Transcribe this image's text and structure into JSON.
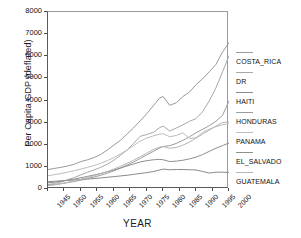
{
  "chart_data": {
    "type": "line",
    "title": "",
    "xlabel": "YEAR",
    "ylabel": "Per Capita GDP (deflated)",
    "xlim": [
      1945,
      2000
    ],
    "ylim": [
      0,
      8000
    ],
    "grid": false,
    "legend_position": "right",
    "xticks": [
      "1945",
      "1950",
      "1955",
      "1960",
      "1965",
      "1970",
      "1975",
      "1980",
      "1985",
      "1990",
      "1995",
      "2000"
    ],
    "yticks": [
      "0",
      "1000",
      "2000",
      "3000",
      "4000",
      "5000",
      "6000",
      "7000",
      "8000"
    ],
    "x": [
      1945,
      1947,
      1949,
      1951,
      1953,
      1955,
      1957,
      1959,
      1961,
      1963,
      1965,
      1967,
      1969,
      1971,
      1973,
      1975,
      1977,
      1979,
      1980,
      1982,
      1984,
      1986,
      1988,
      1990,
      1992,
      1994,
      1996,
      1998,
      2000
    ],
    "series": [
      {
        "name": "COSTA_RICA",
        "color": "#9a9a9a",
        "values": [
          880,
          930,
          980,
          1040,
          1120,
          1240,
          1320,
          1420,
          1560,
          1760,
          1980,
          2200,
          2480,
          2760,
          3080,
          3400,
          3760,
          4120,
          4180,
          3780,
          3900,
          4180,
          4380,
          4720,
          4980,
          5300,
          5620,
          6180,
          6620
        ]
      },
      {
        "name": "DR",
        "color": "#a8a8a8",
        "values": [
          200,
          250,
          320,
          420,
          520,
          640,
          760,
          860,
          980,
          1120,
          1300,
          1520,
          1760,
          2060,
          2380,
          2460,
          2560,
          2780,
          2840,
          2620,
          2760,
          2900,
          3060,
          3180,
          3500,
          3980,
          4560,
          5280,
          6020
        ]
      },
      {
        "name": "HAITI",
        "color": "#8a8a8a",
        "values": [
          330,
          350,
          370,
          390,
          410,
          430,
          450,
          470,
          500,
          530,
          560,
          590,
          620,
          660,
          700,
          740,
          790,
          860,
          900,
          870,
          880,
          880,
          870,
          860,
          790,
          720,
          760,
          760,
          750
        ]
      },
      {
        "name": "HONDURAS",
        "color": "#9c9c9c",
        "values": [
          170,
          200,
          240,
          290,
          340,
          400,
          470,
          540,
          620,
          710,
          820,
          940,
          1080,
          1220,
          1380,
          1540,
          1700,
          1860,
          1920,
          1960,
          2060,
          2200,
          2360,
          2540,
          2700,
          2860,
          3060,
          3320,
          3980
        ]
      },
      {
        "name": "PANAMA",
        "color": "#bdbdbd",
        "values": [
          600,
          650,
          700,
          760,
          830,
          900,
          980,
          1060,
          1160,
          1280,
          1420,
          1580,
          1760,
          1960,
          2160,
          2300,
          2400,
          2480,
          2500,
          2360,
          2420,
          2540,
          2280,
          2320,
          2560,
          2700,
          2820,
          2900,
          2960
        ]
      },
      {
        "name": "EL_SALVADO",
        "color": "#8f8f8f",
        "values": [
          280,
          310,
          350,
          400,
          450,
          510,
          570,
          630,
          700,
          780,
          860,
          950,
          1040,
          1130,
          1220,
          1280,
          1320,
          1340,
          1320,
          1240,
          1260,
          1300,
          1360,
          1440,
          1560,
          1700,
          1840,
          1960,
          2080
        ]
      },
      {
        "name": "GUATEMALA",
        "color": "#b5b5b5",
        "values": [
          150,
          190,
          240,
          300,
          370,
          440,
          520,
          600,
          690,
          790,
          900,
          1020,
          1160,
          1300,
          1460,
          1620,
          1780,
          1900,
          1920,
          1840,
          1880,
          1980,
          2120,
          2300,
          2480,
          2660,
          2840,
          3000,
          3040
        ]
      }
    ]
  },
  "legend": {
    "entries": [
      {
        "label": "COSTA_RICA"
      },
      {
        "label": "DR"
      },
      {
        "label": "HAITI"
      },
      {
        "label": "HONDURAS"
      },
      {
        "label": "PANAMA"
      },
      {
        "label": "EL_SALVADO"
      },
      {
        "label": "GUATEMALA"
      }
    ]
  }
}
